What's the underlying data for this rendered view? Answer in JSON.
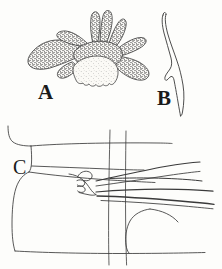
{
  "plate": {
    "title": "",
    "background_color": "#fdfdfb",
    "ink_color": "#2b2b2b",
    "width": 222,
    "height": 269,
    "style": "scientific line drawing with stipple shading"
  },
  "panels": [
    {
      "id": "A",
      "label": "A",
      "name": "panel-a-branched-organ",
      "description": "Branched, finger-like lobed structure with dense stipple shading and a pale scalloped basal lobe",
      "shading": "dense stipple",
      "label_position": {
        "x": 38,
        "y": 82
      }
    },
    {
      "id": "B",
      "label": "B",
      "name": "panel-b-curved-spine",
      "description": "Slender elongate curved spine or hook in outline, with a notch on the inner margin near the base",
      "shading": "outline only",
      "label_position": {
        "x": 157,
        "y": 88
      }
    },
    {
      "id": "C",
      "label": "C",
      "name": "panel-c-lateral-view",
      "description": "Lateral view outline of a segmented body region with an interlocking hook-like appendage and long tapering processes extending to the right; two near-vertical segment boundary lines cross the figure",
      "shading": "outline only",
      "label_position": {
        "x": 13,
        "y": 157
      }
    }
  ],
  "colors": {
    "ink": "#2b2b2b",
    "ink_light": "#555555",
    "stipple": "#3a3a3a",
    "paper": "#fdfdfb"
  }
}
